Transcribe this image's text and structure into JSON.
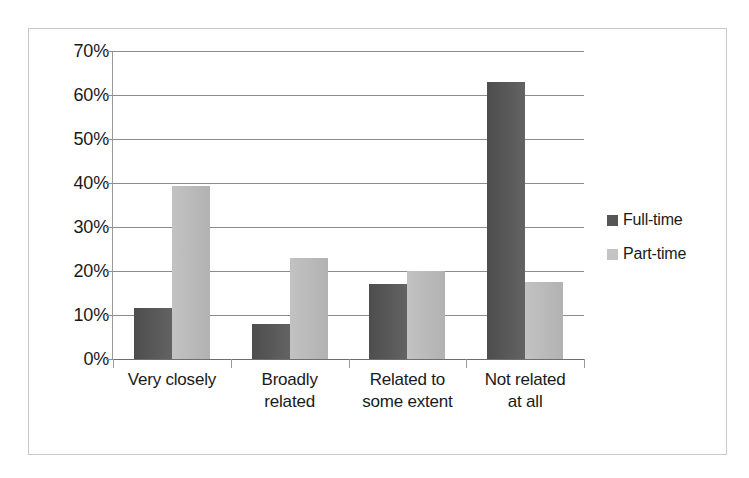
{
  "chart_data": {
    "type": "bar",
    "title": "",
    "subtitle": "",
    "xlabel": "",
    "ylabel": "",
    "ylim": [
      0,
      70
    ],
    "ytick_labels": [
      "70%",
      "60%",
      "50%",
      "40%",
      "30%",
      "20%",
      "10%",
      "0%"
    ],
    "ytick_values": [
      70,
      60,
      50,
      40,
      30,
      20,
      10,
      0
    ],
    "grid": true,
    "legend_position": "right",
    "categories": [
      "Very closely",
      "Broadly related",
      "Related to some extent",
      "Not related at all"
    ],
    "category_label_lines": [
      [
        "Very closely"
      ],
      [
        "Broadly",
        "related"
      ],
      [
        "Related to",
        "some extent"
      ],
      [
        "Not related",
        "at all"
      ]
    ],
    "series": [
      {
        "name": "Full-time",
        "color": "#565656",
        "values": [
          11.5,
          8.0,
          17.0,
          63.0
        ]
      },
      {
        "name": "Part-time",
        "color": "#c4c4c4",
        "values": [
          39.3,
          23.0,
          20.0,
          17.5
        ]
      }
    ]
  },
  "legend": {
    "items": [
      {
        "label": "Full-time"
      },
      {
        "label": "Part-time"
      }
    ]
  },
  "colors": {
    "series_full_time": "#565656",
    "series_part_time": "#c4c4c4",
    "gridline": "#8c8c8c",
    "frame_border": "#c8c8c8",
    "text": "#1a1a1a",
    "background": "#ffffff"
  }
}
